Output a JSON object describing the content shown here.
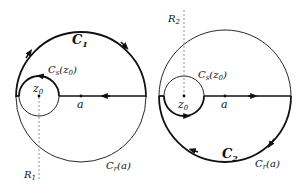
{
  "left_panel": {
    "contour_label": "C",
    "contour_sub": "1",
    "small_circle_label": "C",
    "small_circle_sub": "s",
    "small_circle_arg": "(z",
    "small_circle_arg_sub": "0",
    "small_circle_arg_close": ")",
    "center_label": "z",
    "center_sub": "0",
    "point_label": "a",
    "big_circle_label": "C",
    "big_circle_sub": "r",
    "big_circle_arg": "(a)",
    "ray_label": "R",
    "ray_sub": "1"
  },
  "right_panel": {
    "contour_label": "C",
    "contour_sub": "2",
    "small_circle_label": "C",
    "small_circle_sub": "s",
    "small_circle_arg": "(z",
    "small_circle_arg_sub": "0",
    "small_circle_arg_close": ")",
    "center_label": "z",
    "center_sub": "0",
    "point_label": "a",
    "big_circle_label": "C",
    "big_circle_sub": "r",
    "big_circle_arg": "(a)",
    "ray_label": "R",
    "ray_sub": "2"
  },
  "colors": {
    "stroke": "#111111",
    "dashed": "#888888"
  }
}
